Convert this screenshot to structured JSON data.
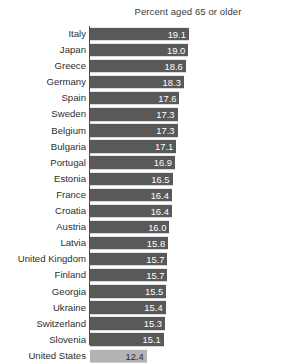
{
  "chart_data": {
    "type": "bar",
    "orientation": "horizontal",
    "title": "Percent aged 65 or older",
    "xlabel": "",
    "ylabel": "",
    "grid": false,
    "legend": null,
    "axis_note": "horizontal axis is truncated; bars do not start at zero",
    "value_label_format": "one decimal",
    "categories": [
      "Italy",
      "Japan",
      "Greece",
      "Germany",
      "Spain",
      "Sweden",
      "Belgium",
      "Bulgaria",
      "Portugal",
      "Estonia",
      "France",
      "Croatia",
      "Austria",
      "Latvia",
      "United Kingdom",
      "Finland",
      "Georgia",
      "Ukraine",
      "Switzerland",
      "Slovenia",
      "United States"
    ],
    "values": [
      19.1,
      19.0,
      18.6,
      18.3,
      17.6,
      17.3,
      17.3,
      17.1,
      16.9,
      16.5,
      16.4,
      16.4,
      16.0,
      15.8,
      15.7,
      15.7,
      15.5,
      15.4,
      15.3,
      15.1,
      12.4
    ],
    "highlight_category": "United States",
    "colors": {
      "bar": "#595959",
      "bar_highlight": "#b4b4b4",
      "value_label": "#ffffff",
      "value_label_highlight": "#2b2b2b",
      "axis": "#4a4a4a",
      "text": "#2e2e2e",
      "background": "#ffffff"
    },
    "scale": {
      "axis_min": 3.4,
      "axis_max": 33.0,
      "px_per_unit": 6.3
    }
  }
}
